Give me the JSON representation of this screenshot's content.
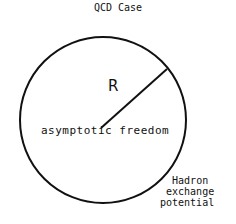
{
  "title": "QCD Case",
  "diagram": {
    "radius_label": "R",
    "inner_label": "asymptotic freedom",
    "outer_label_lines": [
      "Hadron",
      "exchange",
      "potential"
    ],
    "shape": "circle",
    "stroke_color": "#111111"
  }
}
